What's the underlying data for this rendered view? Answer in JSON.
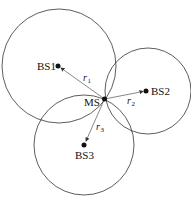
{
  "diagram": {
    "type": "trilateration",
    "mobile_station": {
      "label": "MS",
      "x": 104.5,
      "y": 99
    },
    "base_stations": [
      {
        "label": "BS1",
        "x": 58,
        "y": 66,
        "circle_r": 57,
        "range_label": "r",
        "range_sub": "1"
      },
      {
        "label": "BS2",
        "x": 146,
        "y": 91,
        "circle_r": 43,
        "range_label": "r",
        "range_sub": "2"
      },
      {
        "label": "BS3",
        "x": 84,
        "y": 145,
        "circle_r": 50,
        "range_label": "r",
        "range_sub": "3"
      }
    ],
    "colors": {
      "stroke": "#333333",
      "line": "#555555"
    }
  }
}
